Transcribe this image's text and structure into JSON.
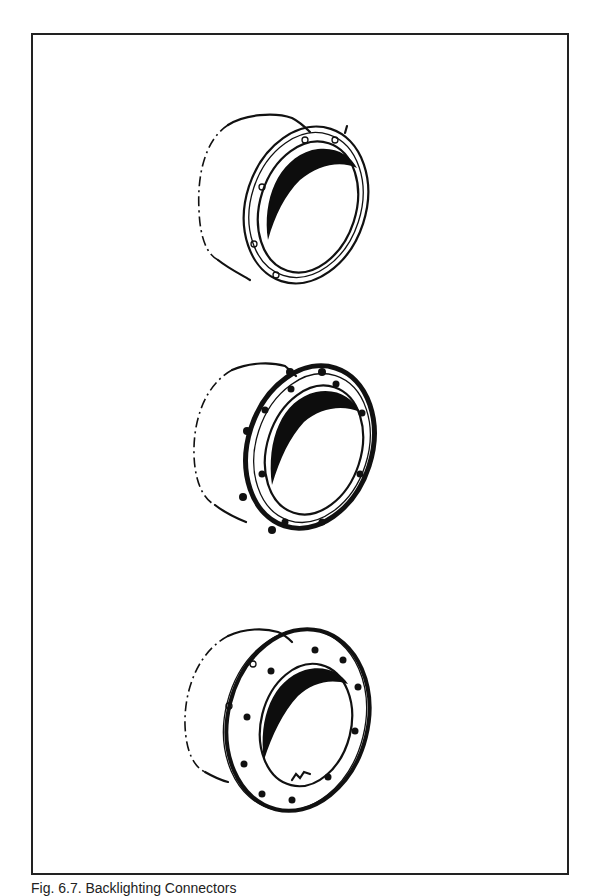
{
  "page": {
    "type": "technical-illustration-plate",
    "caption": "Fig. 6.7. Backlighting Connectors"
  },
  "figure": {
    "frame_color": "#222222",
    "ink_color": "#111111",
    "paper_color": "#ffffff",
    "items": [
      {
        "id": "connector-1",
        "description": "cylindrical housing with thin retaining ring and small clips",
        "bolt_holes": 0
      },
      {
        "id": "connector-2",
        "description": "cylindrical housing with narrow flange and bolt holes",
        "bolt_holes": 8
      },
      {
        "id": "connector-3",
        "description": "cylindrical housing with wide mounting flange and bolt holes",
        "bolt_holes": 10
      }
    ]
  }
}
